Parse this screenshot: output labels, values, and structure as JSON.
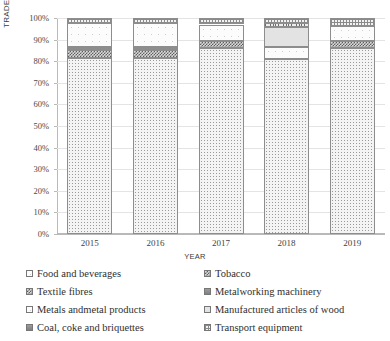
{
  "chart_data": {
    "type": "bar",
    "subtype": "100% stacked column",
    "title": "",
    "xlabel": "YEAR",
    "ylabel": "TRADE VALUE IN THOUSAND OF USD",
    "categories": [
      "2015",
      "2016",
      "2017",
      "2018",
      "2019"
    ],
    "ylim": [
      0,
      100
    ],
    "ytick_labels": [
      "0%",
      "10%",
      "20%",
      "30%",
      "40%",
      "50%",
      "60%",
      "70%",
      "80%",
      "90%",
      "100%"
    ],
    "ytick_values": [
      0,
      10,
      20,
      30,
      40,
      50,
      60,
      70,
      80,
      90,
      100
    ],
    "grid": true,
    "legend_position": "bottom",
    "units": "percent of total",
    "series": [
      {
        "name": "Food and beverages",
        "pattern": "dots",
        "values": [
          81.5,
          81.5,
          86.0,
          81.0,
          86.0
        ]
      },
      {
        "name": "Tobacco",
        "pattern": "checker-dark",
        "values": [
          0.0,
          0.0,
          0.0,
          0.0,
          0.0
        ]
      },
      {
        "name": "Textile fibres",
        "pattern": "checker-dark",
        "values": [
          3.5,
          3.5,
          3.5,
          0.0,
          3.5
        ]
      },
      {
        "name": "Metalworking machinery",
        "pattern": "solid-dark",
        "values": [
          1.5,
          1.5,
          0.0,
          0.0,
          0.0
        ]
      },
      {
        "name": "Metals andmetal products",
        "pattern": "open",
        "values": [
          11.0,
          11.0,
          7.5,
          5.5,
          7.0
        ]
      },
      {
        "name": "Manufactured articles of wood",
        "pattern": "lightgrey",
        "values": [
          0.0,
          0.0,
          0.0,
          9.5,
          0.0
        ]
      },
      {
        "name": "Coal, coke and briquettes",
        "pattern": "vstripe",
        "values": [
          0.0,
          0.0,
          0.0,
          1.5,
          0.0
        ]
      },
      {
        "name": "Transport equipment",
        "pattern": "grid-fine",
        "values": [
          2.5,
          2.5,
          3.0,
          2.5,
          3.5
        ]
      }
    ]
  },
  "legend": {
    "rows": [
      {
        "left": {
          "label": "Food and beverages",
          "pattern": "open"
        },
        "right": {
          "label": "Tobacco",
          "pattern": "checker-dark"
        }
      },
      {
        "left": {
          "label": "Textile fibres",
          "pattern": "checker-dark"
        },
        "right": {
          "label": "Metalworking machinery",
          "pattern": "solid-dark"
        }
      },
      {
        "left": {
          "label": "Metals andmetal products",
          "pattern": "open"
        },
        "right": {
          "label": "Manufactured articles of wood",
          "pattern": "lightgrey"
        }
      },
      {
        "left": {
          "label": "Coal, coke and briquettes",
          "pattern": "solid-dark"
        },
        "right": {
          "label": "Transport equipment",
          "pattern": "grid-fine"
        }
      }
    ]
  }
}
